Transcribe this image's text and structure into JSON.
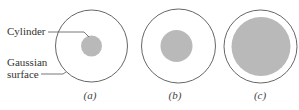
{
  "labels": {
    "cylinder": "Cylinder",
    "gaussian_line1": "Gaussian",
    "gaussian_line2": "surface"
  },
  "panels": [
    {
      "caption": "(a)",
      "outer": {
        "cx": 91.5,
        "cy": 46,
        "r": 36
      },
      "inner": {
        "cx": 91.5,
        "cy": 46,
        "r": 10.5
      }
    },
    {
      "caption": "(b)",
      "outer": {
        "cx": 178.5,
        "cy": 46,
        "r": 37
      },
      "inner": {
        "cx": 176.5,
        "cy": 46,
        "r": 16
      }
    },
    {
      "caption": "(c)",
      "outer": {
        "cx": 260.5,
        "cy": 46.5,
        "r": 36.5
      },
      "inner": {
        "cx": 261,
        "cy": 46.5,
        "r": 29.5
      }
    }
  ],
  "colors": {
    "outline": "#555555",
    "cylinder_fill": "#b9b9b9",
    "text": "#333333",
    "background": "#ffffff"
  }
}
